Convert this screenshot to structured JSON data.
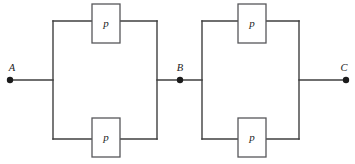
{
  "diagram": {
    "type": "reliability-block-diagram",
    "canvas": {
      "width": 355,
      "height": 164,
      "background": "#ffffff"
    },
    "colors": {
      "wire": "#3f3f3f",
      "box_stroke": "#57575a",
      "box_fill": "#ffffff",
      "node": "#1b1b1b",
      "text": "#1b1b1b"
    },
    "terminals": [
      {
        "id": "A",
        "label": "A",
        "x": 10,
        "y": 80,
        "label_x": 12,
        "label_y": 71
      },
      {
        "id": "B",
        "label": "B",
        "x": 180,
        "y": 80,
        "label_x": 180,
        "label_y": 71
      },
      {
        "id": "C",
        "label": "C",
        "x": 346,
        "y": 80,
        "label_x": 344,
        "label_y": 71
      }
    ],
    "blocks": [
      {
        "id": "block-1",
        "left_rail_x": 53,
        "right_rail_x": 157,
        "top_rail_y": 21,
        "bottom_rail_y": 139,
        "components": [
          {
            "id": "p-top-left",
            "label": "p",
            "x": 92,
            "y": 4,
            "width": 28,
            "height": 39,
            "branch": "top"
          },
          {
            "id": "p-bottom-left",
            "label": "p",
            "x": 92,
            "y": 118,
            "width": 28,
            "height": 39,
            "branch": "bottom"
          }
        ]
      },
      {
        "id": "block-2",
        "left_rail_x": 202,
        "right_rail_x": 299,
        "top_rail_y": 21,
        "bottom_rail_y": 139,
        "components": [
          {
            "id": "p-top-right",
            "label": "p",
            "x": 238,
            "y": 4,
            "width": 28,
            "height": 39,
            "branch": "top"
          },
          {
            "id": "p-bottom-right",
            "label": "p",
            "x": 238,
            "y": 118,
            "width": 28,
            "height": 39,
            "branch": "bottom"
          }
        ]
      }
    ],
    "leads": [
      {
        "id": "lead-a",
        "from_x": 10,
        "to_x": 53,
        "y": 80
      },
      {
        "id": "lead-b",
        "from_x": 157,
        "to_x": 202,
        "y": 80
      },
      {
        "id": "lead-c",
        "from_x": 299,
        "to_x": 346,
        "y": 80
      }
    ],
    "node_dot_radius": 3.2
  }
}
